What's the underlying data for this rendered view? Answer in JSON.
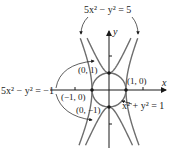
{
  "diagram": {
    "origin_px": [
      109,
      90
    ],
    "unit_px": 17,
    "axes": {
      "x_label": "x",
      "y_label": "y",
      "tick_units": [
        -2,
        2
      ]
    },
    "curves": [
      {
        "id": "hyperbola-a",
        "equation": "5x^2 - y^2 = 5",
        "label": "5x² − y² = 5",
        "color": "#6e6e6e"
      },
      {
        "id": "hyperbola-b",
        "equation": "5x^2 - y^2 = -1",
        "label": "5x² − y² = −1",
        "color": "#6e6e6e"
      },
      {
        "id": "circle",
        "equation": "x^2 + y^2 = 1",
        "label": "x² + y² = 1",
        "color": "#6e6e6e"
      }
    ],
    "points": [
      {
        "label": "(0, 1)",
        "x": 0,
        "y": 1
      },
      {
        "label": "(1, 0)",
        "x": 1,
        "y": 0
      },
      {
        "label": "(−1, 0)",
        "x": -1,
        "y": 0
      },
      {
        "label": "(0, −1)",
        "x": 0,
        "y": -1
      }
    ]
  }
}
